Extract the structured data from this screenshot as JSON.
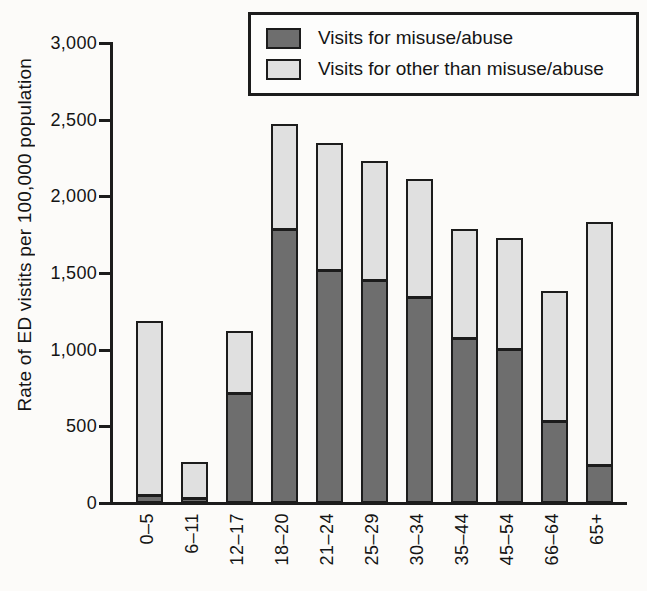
{
  "chart_data": {
    "type": "bar",
    "stacked": true,
    "title": "",
    "xlabel": "",
    "ylabel": "Rate of ED vistits per 100,000 population",
    "ylim": [
      0,
      3000
    ],
    "yticks": [
      0,
      500,
      1000,
      1500,
      2000,
      2500,
      3000
    ],
    "ytick_labels": [
      "0",
      "500",
      "1,000",
      "1,500",
      "2,000",
      "2,500",
      "3,000"
    ],
    "grid": false,
    "legend_position": "top-right",
    "categories": [
      "0–5",
      "6–11",
      "12–17",
      "18–20",
      "21–24",
      "25–29",
      "30–34",
      "35–44",
      "45–54",
      "66–64",
      "65+"
    ],
    "series": [
      {
        "name": "Visits for misuse/abuse",
        "color": "#6e6e6e",
        "values": [
          45,
          25,
          710,
          1780,
          1510,
          1450,
          1340,
          1070,
          1000,
          530,
          240
        ]
      },
      {
        "name": "Visits for other than misuse/abuse",
        "color": "#e0e0e0",
        "values": [
          1145,
          245,
          410,
          690,
          840,
          780,
          770,
          720,
          730,
          850,
          1590
        ]
      }
    ],
    "totals": [
      1190,
      270,
      1120,
      2470,
      2350,
      2230,
      2110,
      1790,
      1730,
      1380,
      1830
    ],
    "axis_color": "#1c1c1c"
  }
}
